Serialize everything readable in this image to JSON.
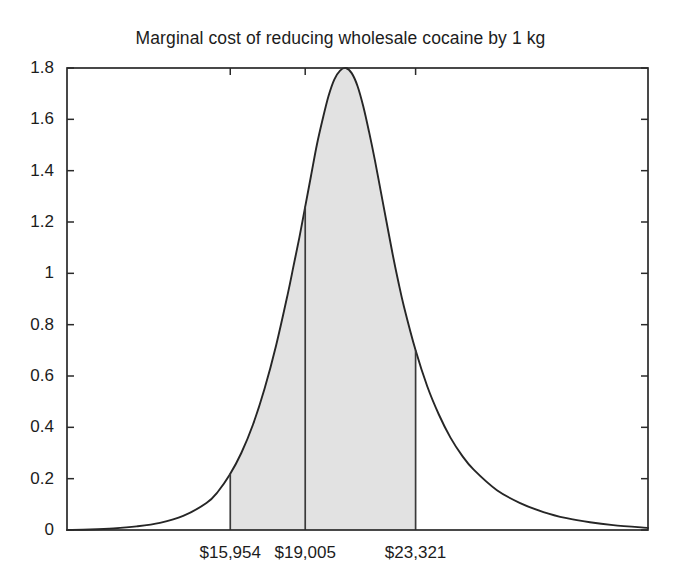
{
  "chart_data": {
    "type": "area",
    "title": "Marginal cost of reducing wholesale cocaine by 1 kg",
    "xlabel": "",
    "ylabel": "",
    "ylim": [
      0,
      1.8
    ],
    "xlim": [
      0,
      100
    ],
    "grid": false,
    "legend": "none",
    "y_ticks": [
      "0",
      "0.2",
      "0.4",
      "0.6",
      "0.8",
      "1",
      "1.2",
      "1.4",
      "1.6",
      "1.8"
    ],
    "y_tick_values": [
      0,
      0.2,
      0.4,
      0.6,
      0.8,
      1,
      1.2,
      1.4,
      1.6,
      1.8
    ],
    "x_ticks": [
      "$15,954",
      "$19,005",
      "$23,321"
    ],
    "x_tick_values": [
      15954,
      19005,
      23321
    ],
    "annotations": {
      "lower_bound_label": "$15,954",
      "median_label": "$19,005",
      "upper_bound_label": "$23,321",
      "shaded_region_meaning": "interval between $15,954 and $23,321",
      "peak_value": 1.8,
      "density_at_lower_bound": 0.58,
      "density_at_upper_bound": 0.39
    },
    "series": [
      {
        "name": "probability density",
        "x": [
          0,
          4,
          8,
          12,
          16,
          20,
          24,
          26,
          28,
          30,
          32,
          34,
          36,
          38,
          39,
          40,
          41,
          42,
          43,
          44,
          45,
          46,
          47,
          48,
          49,
          50,
          51,
          52,
          53,
          54,
          55,
          56,
          57,
          58,
          60,
          62,
          64,
          66,
          68,
          70,
          74,
          78,
          82,
          86,
          90,
          94,
          100
        ],
        "y": [
          0.0,
          0.002,
          0.006,
          0.014,
          0.028,
          0.055,
          0.105,
          0.15,
          0.215,
          0.3,
          0.41,
          0.55,
          0.72,
          0.92,
          1.03,
          1.14,
          1.26,
          1.38,
          1.5,
          1.6,
          1.69,
          1.755,
          1.79,
          1.8,
          1.78,
          1.73,
          1.65,
          1.55,
          1.44,
          1.32,
          1.2,
          1.08,
          0.97,
          0.87,
          0.7,
          0.56,
          0.45,
          0.36,
          0.29,
          0.235,
          0.155,
          0.105,
          0.07,
          0.046,
          0.03,
          0.019,
          0.008
        ]
      }
    ],
    "shaded_interval": {
      "x_start": 28.1,
      "x_end": 60.0,
      "color": "#e2e2e2"
    },
    "vertical_lines": [
      {
        "x": 28.1,
        "label": "$15,954"
      },
      {
        "x": 41.0,
        "label": "$19,005"
      },
      {
        "x": 60.0,
        "label": "$23,321"
      }
    ]
  },
  "axes": {
    "plot_box": {
      "left": 67,
      "top": 68,
      "right": 648,
      "bottom": 530
    },
    "line_color": "#2a2a2a"
  }
}
